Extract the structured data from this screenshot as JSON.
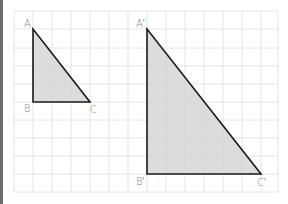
{
  "figure": {
    "grid": {
      "columns": 14,
      "rows": 10,
      "line_color": "#e2e2e2"
    },
    "fill_color": "#d6d6d6",
    "stroke_color": "#1a1a1a",
    "label_color": "#8a8a8a",
    "triangle_small": {
      "labels": {
        "a": "A",
        "b": "B",
        "c": "C"
      }
    },
    "triangle_large": {
      "labels": {
        "a": "A′",
        "b": "B′",
        "c": "C′"
      }
    }
  }
}
